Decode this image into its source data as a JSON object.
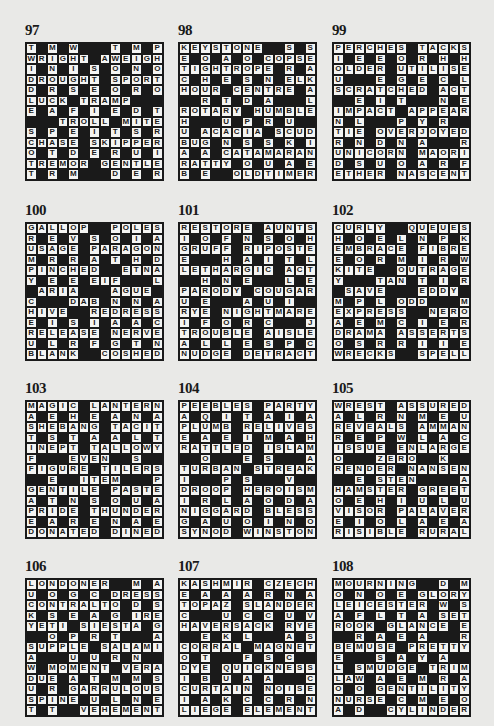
{
  "puzzles": [
    {
      "number": "97",
      "x": 25,
      "y": 42,
      "rows": [
        "T#M#W###T#M#P",
        "WRIGHT#AWEIGH",
        "I#N#I#S#O#N#O",
        "DROUGHT#SPORT",
        "D#R#S#E#O#R#O",
        "LUCK#TRAMP###",
        "E#A#F#I#E#D#T",
        "###TROLL#MITE",
        "S#P#E#I#T#S#R",
        "CHASE#SKIPPER",
        "O#T#D#E#R#U#I",
        "TREMOR#GENTLE",
        "T#R#M###D#E#R"
      ]
    },
    {
      "number": "98",
      "x": 178,
      "y": 42,
      "rows": [
        "KEYSTONE##S#S",
        "E#O#A#O#COPSE",
        "TIGHTROPE#R#A",
        "C#H#E#S#N#ELK",
        "HOUR#CENTRE#A",
        "##R#T#D#A###L",
        "ROTARY#HUMBLE",
        "H###U#P#R#U##",
        "U#ACACIA#SCUD",
        "BUG#N#S#S#K#I",
        "A#A#CATAMARAN",
        "RATTY#O#U#A#E",
        "B#E##OLDTIMER"
      ]
    },
    {
      "number": "99",
      "x": 332,
      "y": 42,
      "rows": [
        "PERCHES#TACKS",
        "I#E#E#O#R#H#H",
        "OLDER#UTILISE",
        "U###E#G#E#C#L",
        "SCRATCHED#ACT",
        "##E#I#T###N#E",
        "IMPACT#APPEAR",
        "N#L###P#Y#R##",
        "TIE#OVERJOYED",
        "R#N#D#N#A###R",
        "UNICORN#MAORI",
        "D#S#U#O#A#R#F",
        "ETHER#NASCENT"
      ]
    },
    {
      "number": "100",
      "x": 25,
      "y": 222,
      "rows": [
        "GALLOP##POLES",
        "R#E#V#S#O#I#A",
        "USAGE#PARAGON",
        "M#R#R#A#T#H#D",
        "PINCHED##ETNA",
        "Y#E#E#EIF###L",
        "#ARIA###AGUE#",
        "C###DAB#N#N#A",
        "HIVE##REDRESS",
        "E#I#S#I#A#A#C",
        "RELEASE#NERVE",
        "U#L#R#F#G#T#N",
        "BLANK##COSHED"
      ]
    },
    {
      "number": "101",
      "x": 178,
      "y": 222,
      "rows": [
        "RESTORE#AUNTS",
        "I#O#F#N#S#O#H",
        "GRUFF#RIPOSTE",
        "E###H#A#I#T#L",
        "LETHARGIC#ACT",
        "##H#N#E###L#E",
        "PARODY#COUGAR",
        "U#E###A#U#I##",
        "RYE#NIGHTMARE",
        "I#F#O#R#C###J",
        "TROUBLE#AISLE",
        "A#L#L#E#S#P#C",
        "NUDGE#DETRACT"
      ]
    },
    {
      "number": "102",
      "x": 332,
      "y": 222,
      "rows": [
        "CURLY##QUEUES",
        "H#O#E#L#N#P#K",
        "EMBRACE#FIBRE",
        "E#O#R#M#I#R#W",
        "KITE##OUTRAGE",
        "Y###TAN#T#I#R",
        "#SAVE###EDDY#",
        "M#P#L#ODD###M",
        "EXPRESS##NERO",
        "A#E#M#C#I#E#R",
        "DRAMA#ASSERTS",
        "O#S#R#R#I#I#E",
        "WRECKS##SPELL"
      ]
    },
    {
      "number": "103",
      "x": 25,
      "y": 400,
      "rows": [
        "MAGIC#LANTERN",
        "A#E#H#E#A#N#A",
        "SHEBANG#TACIT",
        "T#S#T#A#A#L#T",
        "INEPT#TALLOWY",
        "F###EVEN##S##",
        "FIGURE#TILERS",
        "##E##ITEM###P",
        "GENTILE#PASTE",
        "A#T#N#S#O#U#A",
        "PRIDE#THUNDER",
        "E#A#R#E#N#A#E",
        "DONATED#DINED"
      ]
    },
    {
      "number": "104",
      "x": 178,
      "y": 400,
      "rows": [
        "PEEBLES#PARTY",
        "A#Q#I#T#A#I#A",
        "PLUMB#RELIVES",
        "E#A#E#I#M#A#H",
        "RATTLED#ISLAM",
        "##O###E#S###A",
        "TURBAN#STREAK",
        "I###P#S###V##",
        "DROOP#HEROISM",
        "I#R#L#A#O#D#A",
        "NIGGARD#BLESS",
        "G#A#U#O#I#N#O",
        "SYNOD#WINSTON"
      ]
    },
    {
      "number": "105",
      "x": 332,
      "y": 400,
      "rows": [
        "WREST#ASSURED",
        "A#L#R#N#M#E#U",
        "REVEALS#AMMAN",
        "R#E#P#W#L#A#C",
        "ISSUE#ENLARGE",
        "O###ZERO##K##",
        "RENDER#NANSEN",
        "##E#STEN####A",
        "HAMSTER#GREET",
        "O#E#H#I#U#L#U",
        "VISOR#PALAVER",
        "E#I#O#L#A#E#A",
        "RISIBLE#RURAL"
      ]
    },
    {
      "number": "106",
      "x": 25,
      "y": 578,
      "rows": [
        "LONDONER##M#A",
        "U#O#G#C#DRESS",
        "CONTRALTO#D#S",
        "K#S#E#A#G#IRE",
        "YETI#SIESTA#G",
        "##O#P#R#T###A",
        "SUPPLE#SALAMI",
        "A###U#U#R#N##",
        "W#MOMENT#VERA",
        "DUE#A#T#M#M#S",
        "U#R#GARRULOUS",
        "SPINE#U#L#N#E",
        "T#T##VEHEMENT"
      ]
    },
    {
      "number": "107",
      "x": 178,
      "y": 578,
      "rows": [
        "KASHMIR#CZECH",
        "E#A#A#A#R#N#A",
        "TOPAZ#SLANDER",
        "C###U#C#C#U#V",
        "HAVERSACK#RYE",
        "##E#K#L###A#S",
        "CORRAL#MAGNET",
        "O#T###F#S#C##",
        "DYE#QUICKNESS",
        "I#B#U#A#A###C",
        "CURTAIN#NOISE",
        "I#A#K#C#C#R#N",
        "LIEGE#ELEMENT"
      ]
    },
    {
      "number": "108",
      "x": 332,
      "y": 578,
      "rows": [
        "MOURNING##D#M",
        "O#N#O#E#GLORY",
        "LEICESTER#W#S",
        "A#F#L#T#A#SET",
        "ROOK#GLANCE#E",
        "##R#A#E#A###R",
        "BEMUSE#PRETTY",
        "E###S#A#Y#A##",
        "L#SMUDGE#TRIM",
        "LAW#A#E#M#R#A",
        "O#O#GENTILITY",
        "NURSE#C#M#E#O",
        "A#D##CYLINDER"
      ]
    }
  ]
}
